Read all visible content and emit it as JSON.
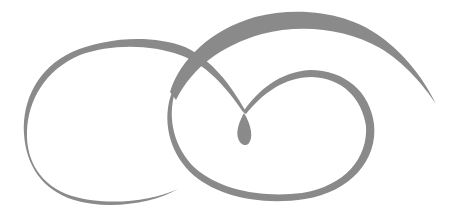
{
  "image": {
    "description": "Decorative calligraphic swirl ornament with two interlocking loops, a sweeping top arc and a teardrop flourish",
    "background_color": "#ffffff",
    "stroke_color": "#8a8a8a",
    "elements": [
      "left-loop",
      "top-sweep-arc",
      "right-loop",
      "teardrop-flourish"
    ]
  }
}
